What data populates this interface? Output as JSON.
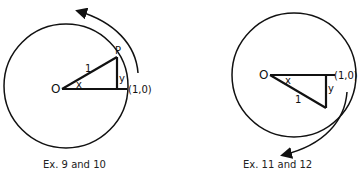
{
  "figures": [
    {
      "id": "left",
      "labels": {
        "origin": "O",
        "hypotenuse": "1",
        "angle": "x",
        "opposite": "y",
        "point": "P",
        "point_on_axis": "(1,0)"
      },
      "rotation_direction": "counterclockwise",
      "caption": "Ex. 9 and 10"
    },
    {
      "id": "right",
      "labels": {
        "origin": "O",
        "hypotenuse": "1",
        "angle": "x",
        "opposite": "y",
        "point_on_axis": "(1,0)"
      },
      "rotation_direction": "clockwise",
      "caption": "Ex. 11 and 12"
    }
  ]
}
